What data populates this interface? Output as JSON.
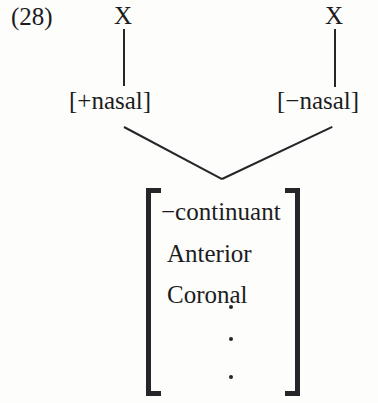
{
  "figure": {
    "example_number": "(28)",
    "type": "autosegmental-feature-geometry-diagram"
  },
  "tier_skeletal": {
    "left_slot": "X",
    "right_slot": "X"
  },
  "tier_nasal": {
    "left_feature": "[+nasal]",
    "right_feature": "[−nasal]"
  },
  "feature_matrix": {
    "rows": [
      "−continuant",
      "Anterior",
      "Coronal"
    ],
    "ellipsis_dots": 3
  },
  "style": {
    "ink_color": "#25252a",
    "text_color": "#1c1c20",
    "background_color": "#fdfdfc"
  }
}
